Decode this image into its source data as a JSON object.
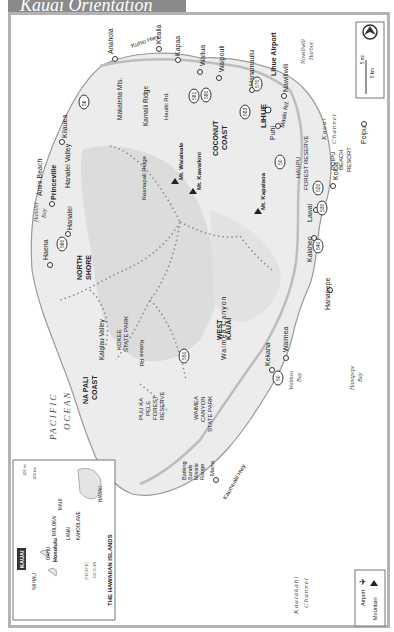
{
  "title": "Kauai Orientation",
  "compass": {
    "icon": "north-arrow-icon"
  },
  "scale": {
    "mi_label": "5 mi",
    "km_label": "5 km",
    "zero": "0"
  },
  "legend": {
    "items": [
      {
        "label": "Airport",
        "icon": "airport-icon"
      },
      {
        "label": "Mountain",
        "icon": "mountain-icon"
      }
    ]
  },
  "waters": {
    "pacific": [
      "PACIFIC",
      "OCEAN"
    ],
    "hanalei_bay": [
      "Hanalei",
      "Bay"
    ],
    "waimea_bay": [
      "Waimea",
      "Bay"
    ],
    "hanapepe_bay": [
      "Hanapepe",
      "Bay"
    ],
    "kaulakahi": [
      "Kaulakahi",
      "Channel"
    ],
    "kauai_channel": [
      "Kauai",
      "Channel"
    ],
    "nawiliwili_harbor": [
      "Nawiliwili",
      "Harbor"
    ]
  },
  "regions": {
    "north_shore": [
      "NORTH",
      "SHORE"
    ],
    "na_pali": [
      "NA PALI",
      "COAST"
    ],
    "west_kauai": [
      "WEST",
      "KAUAI"
    ],
    "coconut_coast": [
      "COCONUT",
      "COAST"
    ],
    "poipu_resort": [
      "POIPU",
      "BEACH",
      "RESORT"
    ],
    "kokee": [
      "KOKEE",
      "STATE PARK"
    ],
    "waimea_canyon": [
      "WAIMEA",
      "CANYON",
      "STATE PARK"
    ],
    "puu_ka_pele": [
      "PUU KA",
      "PELE",
      "FOREST",
      "RESERVE"
    ],
    "haupu": [
      "HAUPU",
      "FOREST RESERVE"
    ],
    "barking_sands": [
      "Barking",
      "Sands",
      "Missile",
      "Range"
    ]
  },
  "towns": [
    "Anahola",
    "Kealia",
    "Kapaa",
    "Wailua",
    "Waipouli",
    "Hanamaulu",
    "Lihue Airport",
    "Nawiliwili",
    "LIHUE",
    "Puhi",
    "Koloa",
    "Poipu",
    "Lawai",
    "Kalaheo",
    "Hanapepe",
    "Waimea",
    "Kekaha",
    "Mana",
    "Haena",
    "Hanalei",
    "Princeville",
    "Kilauea",
    "Anini Beach"
  ],
  "mountains": [
    "Mt. Waialeale",
    "Mt. Kawaikini",
    "Mt. Kapalaoa"
  ],
  "features": [
    "Hanalei Valley",
    "Kalalau Valley",
    "Waimea Canyon",
    "Keanapali Ridge",
    "Makaleha Mts.",
    "Kamalii Ridge"
  ],
  "roads": [
    "Kuhio Hwy.",
    "Kuhio Hwy",
    "Hauiki Rd.",
    "Kaumualii Hwy.",
    "Kokee Rd.",
    "Kokee Rd",
    "Maalo Rd.",
    "Waimea Canyon Dr.",
    "Kaumualii Hwy"
  ],
  "route_numbers": [
    "56",
    "56",
    "56",
    "581",
    "580",
    "583",
    "570",
    "50",
    "520",
    "530",
    "540",
    "50",
    "550",
    "550",
    "560",
    "50"
  ],
  "inset": {
    "title": "THE HAWAIIAN ISLANDS",
    "islands": [
      "NIIHAU",
      "KAUAI",
      "OAHU",
      "MOLOKAI",
      "MAUI",
      "LANAI",
      "KAHOOLAWE",
      "HAWAII"
    ],
    "capital": "Honolulu",
    "ocean": [
      "PACIFIC",
      "OCEAN"
    ],
    "scale": {
      "mi": "100 mi",
      "km": "100 km",
      "zero": "0"
    }
  }
}
